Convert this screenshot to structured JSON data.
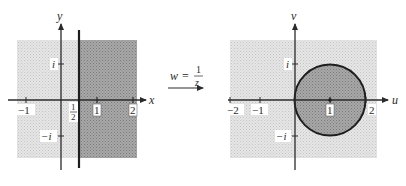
{
  "figure": {
    "mapping": {
      "lhs": "w",
      "equals": "=",
      "numerator": "1",
      "denominator": "z"
    },
    "left_plane": {
      "x_axis_label": "x",
      "y_axis_label": "y",
      "x_ticks": [
        {
          "label": "−1",
          "value": -1
        },
        {
          "label": "1",
          "value": 1
        },
        {
          "label": "2",
          "value": 2
        }
      ],
      "y_ticks": [
        {
          "label": "i",
          "value": 1
        },
        {
          "label": "−i",
          "value": -1
        }
      ],
      "line_label_numerator": "1",
      "line_label_denominator": "2",
      "line": "Re(z) = 1/2",
      "shaded_region": "Re(z) > 1/2"
    },
    "right_plane": {
      "x_axis_label": "u",
      "y_axis_label": "v",
      "x_ticks": [
        {
          "label": "−2",
          "value": -2
        },
        {
          "label": "−1",
          "value": -1
        },
        {
          "label": "1",
          "value": 1
        },
        {
          "label": "2",
          "value": 2
        }
      ],
      "y_ticks": [
        {
          "label": "i",
          "value": 1
        },
        {
          "label": "−i",
          "value": -1
        }
      ],
      "circle": {
        "center": "1",
        "radius": 1,
        "label": "|w − 1| = 1"
      },
      "shaded_region": "|w − 1| < 1"
    },
    "colors": {
      "light_shade": "#dcdcdc",
      "dark_shade": "#9a9a9a",
      "axis": "#2b2b2b",
      "boundary": "#1e1e1e"
    }
  }
}
